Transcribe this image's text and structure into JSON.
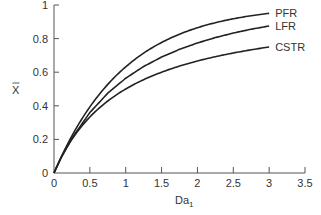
{
  "chart_data": {
    "type": "line",
    "title": "",
    "xlabel": "Da",
    "xlabel_subscript": "1",
    "ylabel": "X",
    "ylabel_overbar": true,
    "xlim": [
      0,
      3.5
    ],
    "ylim": [
      0,
      1
    ],
    "xticks": [
      0,
      0.5,
      1,
      1.5,
      2,
      2.5,
      3,
      3.5
    ],
    "xtick_labels": [
      "0",
      "0.5",
      "1",
      "1.5",
      "2",
      "2.5",
      "3",
      "3.5"
    ],
    "yticks": [
      0,
      0.2,
      0.4,
      0.6,
      0.8,
      1
    ],
    "ytick_labels": [
      "0",
      "0.2",
      "0.4",
      "0.6",
      "0.8",
      "1"
    ],
    "grid": false,
    "legend_position": "inline labels at right end of curves",
    "x": [
      0,
      0.1,
      0.25,
      0.5,
      0.75,
      1,
      1.25,
      1.5,
      1.75,
      2,
      2.25,
      2.5,
      2.75,
      3
    ],
    "series": [
      {
        "name": "PFR",
        "values": [
          0,
          0.095,
          0.221,
          0.393,
          0.528,
          0.632,
          0.713,
          0.777,
          0.826,
          0.865,
          0.895,
          0.918,
          0.936,
          0.95
        ]
      },
      {
        "name": "LFR",
        "values": [
          0,
          0.091,
          0.207,
          0.36,
          0.475,
          0.564,
          0.634,
          0.69,
          0.736,
          0.774,
          0.806,
          0.833,
          0.856,
          0.875
        ]
      },
      {
        "name": "CSTR",
        "values": [
          0,
          0.091,
          0.2,
          0.333,
          0.429,
          0.5,
          0.556,
          0.6,
          0.636,
          0.667,
          0.692,
          0.714,
          0.733,
          0.75
        ]
      }
    ],
    "colors": {
      "line": "#222222",
      "axis": "#555555",
      "text": "#333333"
    }
  }
}
